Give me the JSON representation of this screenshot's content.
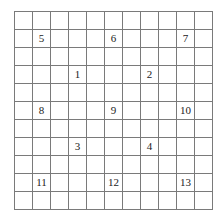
{
  "grid": {
    "rows": 11,
    "cols": 11,
    "line_color": "#7a7a7a",
    "labels": [
      {
        "row": 1,
        "col": 1,
        "text": "5"
      },
      {
        "row": 1,
        "col": 5,
        "text": "6"
      },
      {
        "row": 1,
        "col": 9,
        "text": "7"
      },
      {
        "row": 3,
        "col": 3,
        "text": "1"
      },
      {
        "row": 3,
        "col": 7,
        "text": "2"
      },
      {
        "row": 5,
        "col": 1,
        "text": "8"
      },
      {
        "row": 5,
        "col": 5,
        "text": "9"
      },
      {
        "row": 5,
        "col": 9,
        "text": "10"
      },
      {
        "row": 7,
        "col": 3,
        "text": "3"
      },
      {
        "row": 7,
        "col": 7,
        "text": "4"
      },
      {
        "row": 9,
        "col": 1,
        "text": "11"
      },
      {
        "row": 9,
        "col": 5,
        "text": "12"
      },
      {
        "row": 9,
        "col": 9,
        "text": "13"
      }
    ]
  }
}
